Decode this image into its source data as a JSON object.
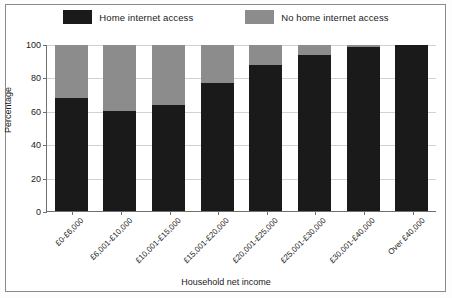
{
  "chart_data": {
    "type": "bar",
    "subtype": "stacked-percentage",
    "title": "",
    "xlabel": "Household net income",
    "ylabel": "Percentage",
    "ylim": [
      0,
      100
    ],
    "yticks": [
      0,
      20,
      40,
      60,
      80,
      100
    ],
    "grid": true,
    "legend_position": "top-center",
    "categories": [
      "£0-£6,000",
      "£6,001-£10,000",
      "£10,001-£15,000",
      "£15,001-£20,000",
      "£20,001-£25,000",
      "£25,001-£30,000",
      "£30,001-£40,000",
      "Over £40,000"
    ],
    "series": [
      {
        "name": "Home internet access",
        "color": "#1a1a1a",
        "values": [
          68,
          60,
          64,
          77,
          88,
          94,
          99,
          100
        ]
      },
      {
        "name": "No home internet access",
        "color": "#8c8c8c",
        "values": [
          32,
          40,
          36,
          23,
          12,
          6,
          1,
          0
        ]
      }
    ]
  },
  "legend": {
    "entries": [
      {
        "label": "Home internet access",
        "swatch": "#1a1a1a"
      },
      {
        "label": "No home internet access",
        "swatch": "#8c8c8c"
      }
    ]
  },
  "axes": {
    "y_title": "Percentage",
    "x_title": "Household net income",
    "y_tick_labels": [
      "0",
      "20",
      "40",
      "60",
      "80",
      "100"
    ]
  },
  "colors": {
    "series_home_access": "#1a1a1a",
    "series_no_access": "#8c8c8c",
    "axis": "#6f6f6f",
    "gridline": "#d2d2d2",
    "frame": "#8a8a8a",
    "background": "#ffffff",
    "text": "#1a1a1a"
  }
}
